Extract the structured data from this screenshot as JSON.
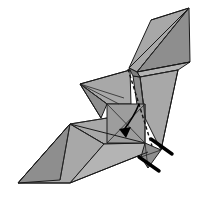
{
  "figure": {
    "background_color": "#ffffff",
    "canvas": {
      "width": 201,
      "height": 202
    }
  },
  "palette": {
    "paper_front": "#a8a8a8",
    "paper_front_alt": "#9d9d9d",
    "paper_shadow": "#8e8e8e",
    "paper_deep_shadow": "#7e7e7e",
    "paper_light": "#b4b4b4",
    "paper_highlight": "#bdbdbd",
    "edge_stroke": "#1a1a1a",
    "crease_stroke": "#262626",
    "fold_line": "#111111",
    "limb_black": "#000000",
    "arrow_black": "#000000"
  },
  "parts": {
    "right_wing": {
      "label": "right wing upper panel",
      "fill_key": "paper_front",
      "points": "189,8 137,72 129,68 151,20"
    },
    "right_wing_lower": {
      "label": "right wing lower panel",
      "fill_key": "paper_shadow",
      "points": "189,8 190,62 137,72"
    },
    "right_wing_band": {
      "label": "right wing narrow band",
      "fill_key": "paper_light",
      "points": "137,72 190,62 178,70 140,77"
    },
    "right_wing_spine": {
      "label": "right wing spine strip",
      "fill_key": "paper_deep_shadow",
      "points": "129,68 137,72 140,77 133,76"
    },
    "right_wing_drop": {
      "label": "right wing trailing panel",
      "fill_key": "paper_front",
      "points": "140,77 178,70 161,150 145,118"
    },
    "right_wing_drop_inner": {
      "label": "right wing trailing inner panel",
      "fill_key": "paper_shadow",
      "points": "133,76 140,77 145,118 138,112"
    },
    "head_spike": {
      "label": "head spike fan",
      "fill_key": "paper_front",
      "points": "80,84 130,70 131,104 107,104"
    },
    "head_spike_under": {
      "label": "head spike lower fan",
      "fill_key": "paper_shadow",
      "points": "80,84 107,104 101,118"
    },
    "body_panel": {
      "label": "central square body panel",
      "fill_key": "paper_front_alt",
      "points": "107,104 145,104 145,143 107,143"
    },
    "left_wing_top": {
      "label": "left wing upper panel",
      "fill_key": "paper_front",
      "points": "70,124 107,118 145,143 104,144"
    },
    "left_wing_main": {
      "label": "left wing main panel",
      "fill_key": "paper_front",
      "points": "70,124 104,144 70,183 18,183"
    },
    "left_wing_fold": {
      "label": "left wing folded panel",
      "fill_key": "paper_shadow",
      "points": "70,124 18,183 60,180"
    },
    "left_wing_edge": {
      "label": "left wing edge panel",
      "fill_key": "paper_light",
      "points": "104,144 145,143 148,152 70,183"
    },
    "tail_panel": {
      "label": "tail wedge panel",
      "fill_key": "paper_shadow",
      "points": "145,143 161,150 148,168 141,157"
    }
  },
  "creases": [
    {
      "name": "right-wing-fold-a",
      "d": "M 151,20 L 189,8"
    },
    {
      "name": "right-wing-fold-b",
      "d": "M 129,68 L 189,8"
    },
    {
      "name": "right-wing-fold-c",
      "d": "M 137,72 L 189,8"
    },
    {
      "name": "right-wing-rib",
      "d": "M 137,72 L 190,62"
    },
    {
      "name": "right-wing-rib2",
      "d": "M 140,77 L 178,70"
    },
    {
      "name": "right-wing-taper",
      "d": "M 178,70 L 161,150"
    },
    {
      "name": "right-wing-inner",
      "d": "M 140,77 L 145,118"
    },
    {
      "name": "head-fan-1",
      "d": "M 80,84 L 130,70"
    },
    {
      "name": "head-fan-2",
      "d": "M 80,84 L 124,98"
    },
    {
      "name": "head-fan-3",
      "d": "M 80,84 L 119,104"
    },
    {
      "name": "head-fan-4",
      "d": "M 80,84 L 107,104"
    },
    {
      "name": "head-fan-5",
      "d": "M 80,84 L 101,118"
    },
    {
      "name": "body-diag-1",
      "d": "M 107,104 L 145,143"
    },
    {
      "name": "body-diag-2",
      "d": "M 145,104 L 107,143"
    },
    {
      "name": "left-wing-fan-1",
      "d": "M 70,124 L 145,143"
    },
    {
      "name": "left-wing-fan-2",
      "d": "M 70,124 L 107,118"
    },
    {
      "name": "left-wing-fan-3",
      "d": "M 70,124 L 104,144"
    },
    {
      "name": "left-wing-center",
      "d": "M 70,124 L 60,180"
    },
    {
      "name": "left-wing-bottom",
      "d": "M 18,183 L 70,183"
    },
    {
      "name": "left-wing-spine",
      "d": "M 70,124 L 18,183"
    },
    {
      "name": "left-wing-lower-edge",
      "d": "M 70,183 L 148,152"
    },
    {
      "name": "tail-crease",
      "d": "M 145,143 L 148,168"
    },
    {
      "name": "tail-crease-2",
      "d": "M 141,157 L 161,150"
    },
    {
      "name": "body-right-edge",
      "d": "M 145,104 L 145,143"
    }
  ],
  "fold_indicators": {
    "dashed_fold": {
      "name": "valley-fold-dashed-line",
      "d": "M 128,69 L 152,146"
    },
    "rotation_arrow": {
      "name": "fold-direction-arrow",
      "curve_d": "M 139,104 C 136,112 130,122 123,131",
      "head_points": "126,138 119,129 131,127"
    }
  }
}
